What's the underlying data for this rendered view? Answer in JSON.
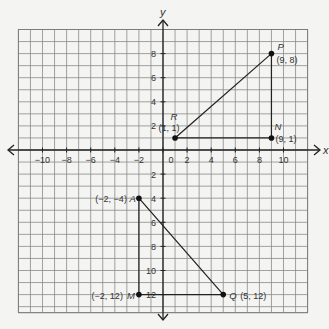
{
  "chart_data": {
    "type": "scatter",
    "title": "",
    "xlabel": "x",
    "ylabel": "y",
    "xlim": [
      -12,
      12
    ],
    "ylim": [
      -13.5,
      10
    ],
    "grid": true,
    "grid_step": 1,
    "x_ticks": [
      {
        "value": -10,
        "label": "−10"
      },
      {
        "value": -8,
        "label": "−8"
      },
      {
        "value": -6,
        "label": "−6"
      },
      {
        "value": -4,
        "label": "−4"
      },
      {
        "value": -2,
        "label": "−2"
      },
      {
        "value": 0,
        "label": "0"
      },
      {
        "value": 2,
        "label": "2"
      },
      {
        "value": 4,
        "label": "4"
      },
      {
        "value": 6,
        "label": "6"
      },
      {
        "value": 8,
        "label": "8"
      },
      {
        "value": 10,
        "label": "10"
      }
    ],
    "y_ticks": [
      {
        "value": 8,
        "label": "8"
      },
      {
        "value": 6,
        "label": "6"
      },
      {
        "value": 4,
        "label": "4"
      },
      {
        "value": 2,
        "label": "2"
      },
      {
        "value": -2,
        "label": "2"
      },
      {
        "value": -4,
        "label": "4"
      },
      {
        "value": -6,
        "label": "6"
      },
      {
        "value": -8,
        "label": "8"
      },
      {
        "value": -10,
        "label": "10"
      },
      {
        "value": -12,
        "label": "12"
      }
    ],
    "points": [
      {
        "name": "P",
        "x": 9,
        "y": 8,
        "label": "(9, 8)"
      },
      {
        "name": "R",
        "x": 1,
        "y": 1,
        "label": "(1, 1)"
      },
      {
        "name": "N",
        "x": 9,
        "y": 1,
        "label": "(9, 1)"
      },
      {
        "name": "A",
        "x": -2,
        "y": -4,
        "label": "(−2, −4)"
      },
      {
        "name": "M",
        "x": -2,
        "y": -12,
        "label": "(−2,  12)"
      },
      {
        "name": "Q",
        "x": 5,
        "y": -12,
        "label": "(5,   12)"
      }
    ],
    "triangles": [
      {
        "name": "PRN",
        "vertices": [
          "P",
          "R",
          "N"
        ]
      },
      {
        "name": "AMQ",
        "vertices": [
          "A",
          "M",
          "Q"
        ]
      }
    ]
  }
}
